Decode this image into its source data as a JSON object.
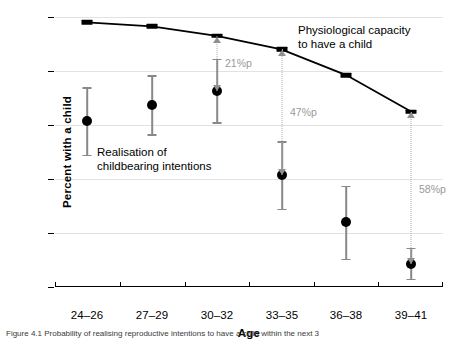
{
  "chart_data": {
    "type": "line",
    "title": "",
    "xlabel": "Age",
    "ylabel": "Percent with a child",
    "categories": [
      "24–26",
      "27–29",
      "30–32",
      "33–35",
      "36–38",
      "39–41"
    ],
    "ylim": [
      0,
      100
    ],
    "yticks": [
      "0",
      "20",
      "40",
      "60",
      "80",
      "100"
    ],
    "ytick_values": [
      0,
      20,
      40,
      60,
      80,
      100
    ],
    "grid": "horizontal",
    "legend": "none",
    "series": [
      {
        "name": "Physiological capacity to have a child",
        "style": "line-with-bar-markers",
        "color": "#000000",
        "values": [
          98,
          96.5,
          93,
          88,
          78.5,
          65
        ]
      },
      {
        "name": "Realisation of childbearing intentions",
        "style": "point-with-error-bars",
        "color": "#000000",
        "error_color": "#888888",
        "values": [
          61.5,
          67.5,
          72.5,
          41.5,
          24,
          8.5
        ],
        "ci_low": [
          49,
          56.5,
          61,
          29,
          10.5,
          3
        ],
        "ci_high": [
          74,
          78.5,
          84.5,
          54,
          37.5,
          14.5
        ]
      }
    ],
    "annotations": [
      {
        "label": "21%p",
        "category": "30–32",
        "from": 93,
        "to": 72.5,
        "color": "#9a9a9a"
      },
      {
        "label": "47%p",
        "category": "33–35",
        "from": 88,
        "to": 41.5,
        "color": "#9a9a9a"
      },
      {
        "label": "58%p",
        "category": "39–41",
        "from": 65,
        "to": 8.5,
        "color": "#9a9a9a"
      }
    ],
    "callouts": [
      {
        "name": "capacity",
        "line1": "Physiological capacity",
        "line2": "to have a child"
      },
      {
        "name": "realisation",
        "line1": "Realisation of",
        "line2": "childbearing intentions"
      }
    ]
  },
  "caption": {
    "text": "Figure 4.1 Probability of realising reproductive intentions to have a child within the next 3"
  }
}
